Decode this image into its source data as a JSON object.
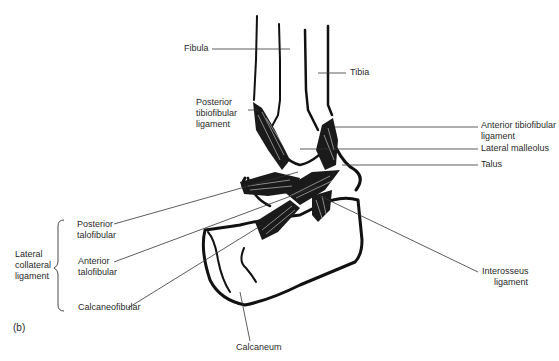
{
  "figure": {
    "panel_label": "(b)",
    "labels": {
      "fibula": "Fibula",
      "tibia": "Tibia",
      "posterior_tibiofibular": [
        "Posterior",
        "tibiofibular",
        "ligament"
      ],
      "anterior_tibiofibular": [
        "Anterior tibiofibular",
        "ligament"
      ],
      "lateral_malleolus": "Lateral malleolus",
      "talus": "Talus",
      "lateral_collateral": [
        "Lateral",
        "collateral",
        "ligament"
      ],
      "posterior_talofibular": [
        "Posterior",
        "talofibular"
      ],
      "anterior_talofibular": [
        "Anterior",
        "talofibular"
      ],
      "calcaneofibular": "Calcaneofibular",
      "interosseus": [
        "Interosseus",
        "ligament"
      ],
      "calcaneum": "Calcaneum"
    }
  }
}
